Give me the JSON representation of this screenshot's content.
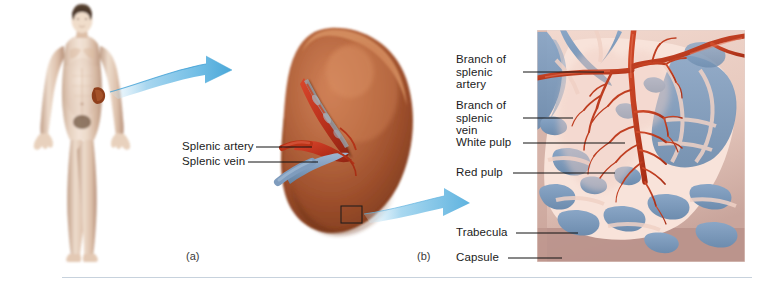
{
  "figure": {
    "background_color": "#ffffff"
  },
  "panel_a": {
    "caption": "(a)",
    "subject": "human-body-anterior-view",
    "organ_marker": "spleen",
    "arrow": "blue-curved-arrow-right"
  },
  "panel_b": {
    "caption": "(b)",
    "subject": "whole-spleen-medial-view",
    "organ_color": "#a8552e",
    "labels": [
      {
        "id": "splenic-artery",
        "text": "Splenic artery",
        "x": 182,
        "y": 141,
        "leader_from": 256,
        "leader_to": 312,
        "leader_y": 147
      },
      {
        "id": "splenic-vein",
        "text": "Splenic vein",
        "x": 182,
        "y": 156,
        "leader_from": 248,
        "leader_to": 318,
        "leader_y": 162
      }
    ],
    "callout_box": "black-rectangle-detail-marker",
    "arrow": "blue-curved-arrow-right"
  },
  "panel_c": {
    "subject": "spleen-internal-microanatomy",
    "labels": [
      {
        "id": "branch-of-splenic-artery",
        "lines": [
          "Branch of",
          "splenic",
          "artery"
        ],
        "x": 456,
        "y": 54,
        "leader_from": 523,
        "leader_to": 604,
        "leader_y": 72
      },
      {
        "id": "branch-of-splenic-vein",
        "lines": [
          "Branch of",
          "splenic",
          "vein"
        ],
        "x": 456,
        "y": 100,
        "leader_from": 523,
        "leader_to": 573,
        "leader_y": 118
      },
      {
        "id": "white-pulp",
        "lines": [
          "White pulp"
        ],
        "x": 456,
        "y": 137,
        "leader_from": 523,
        "leader_to": 625,
        "leader_y": 143
      },
      {
        "id": "red-pulp",
        "lines": [
          "Red pulp"
        ],
        "x": 456,
        "y": 167,
        "leader_from": 513,
        "leader_to": 615,
        "leader_y": 173
      },
      {
        "id": "trabecula",
        "lines": [
          "Trabecula"
        ],
        "x": 456,
        "y": 227,
        "leader_from": 516,
        "leader_to": 578,
        "leader_y": 233
      },
      {
        "id": "capsule",
        "lines": [
          "Capsule"
        ],
        "x": 456,
        "y": 252,
        "leader_from": 508,
        "leader_to": 562,
        "leader_y": 258
      }
    ],
    "colors": {
      "capsule": "#b08e8c",
      "white_pulp": "#f7ded6",
      "red_pulp": "#7c9ac0",
      "artery": "#c13a20",
      "trabecula": "#e9c6bb"
    }
  },
  "divider": {
    "color": "#c7d2dd"
  }
}
